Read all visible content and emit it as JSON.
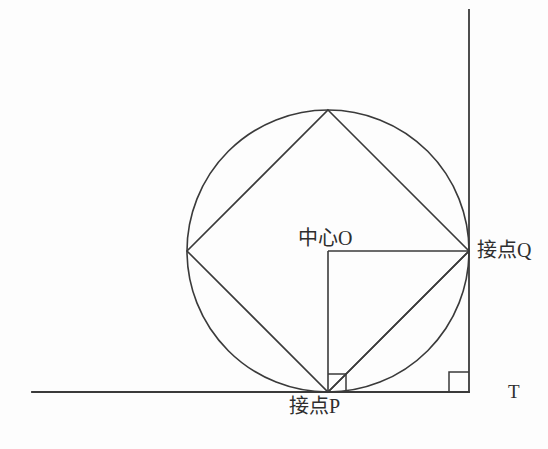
{
  "figure": {
    "type": "geometry-diagram",
    "background_color": "#fdfdfd",
    "stroke_color": "#3a3a3a",
    "stroke_width": 1.6,
    "width": 548,
    "height": 449
  },
  "labels": {
    "center": "中心O",
    "tangent_q": "接点Q",
    "tangent_p": "接点P",
    "corner_t": "T"
  },
  "geometry": {
    "circle": {
      "cx": 328,
      "cy": 251,
      "r": 141
    },
    "points": {
      "O": {
        "x": 328,
        "y": 251
      },
      "P": {
        "x": 328,
        "y": 392
      },
      "Q": {
        "x": 469,
        "y": 251
      },
      "top": {
        "x": 328,
        "y": 110
      },
      "left": {
        "x": 187,
        "y": 251
      },
      "T": {
        "x": 469,
        "y": 392
      }
    },
    "horizontal_line": {
      "x1": 32,
      "y1": 392,
      "x2": 469,
      "y2": 392
    },
    "vertical_line": {
      "x1": 469,
      "y1": 10,
      "x2": 469,
      "y2": 392
    },
    "inscribed_square_vertices": [
      {
        "x": 328,
        "y": 110
      },
      {
        "x": 469,
        "y": 251
      },
      {
        "x": 328,
        "y": 392
      },
      {
        "x": 187,
        "y": 251
      }
    ],
    "radius_segments": [
      {
        "from": "O",
        "to": "Q"
      },
      {
        "from": "O",
        "to": "P"
      }
    ],
    "chord_segment": {
      "from": "P",
      "to": "Q"
    },
    "right_angle_marks": [
      {
        "at": "P",
        "size": 18,
        "name": "right-angle-mark-p"
      },
      {
        "at": "T",
        "size": 20,
        "name": "right-angle-mark-t"
      }
    ]
  }
}
